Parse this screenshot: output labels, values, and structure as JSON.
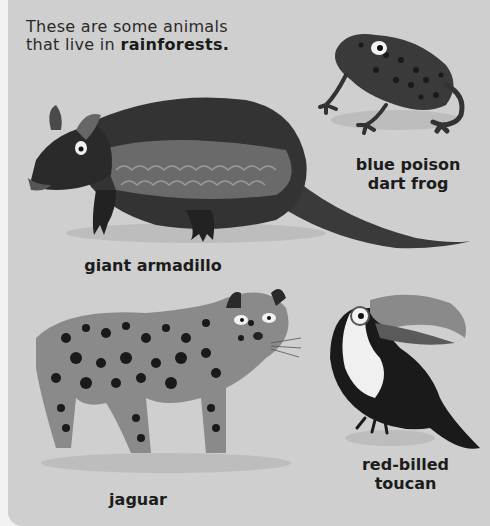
{
  "intro": {
    "text_prefix": "These are some animals",
    "text_line2": "that live in ",
    "emphasis": "rainforests."
  },
  "animals": [
    {
      "name": "blue poison dart frog",
      "label_line1": "blue poison",
      "label_line2": "dart frog"
    },
    {
      "name": "giant armadillo",
      "label_line1": "giant armadillo"
    },
    {
      "name": "jaguar",
      "label_line1": "jaguar"
    },
    {
      "name": "red-billed toucan",
      "label_line1": "red-billed",
      "label_line2": "toucan"
    }
  ],
  "colors": {
    "page": "#cfcfcf",
    "ink": "#1c1c1c",
    "shadow": "#bdbdbd"
  }
}
